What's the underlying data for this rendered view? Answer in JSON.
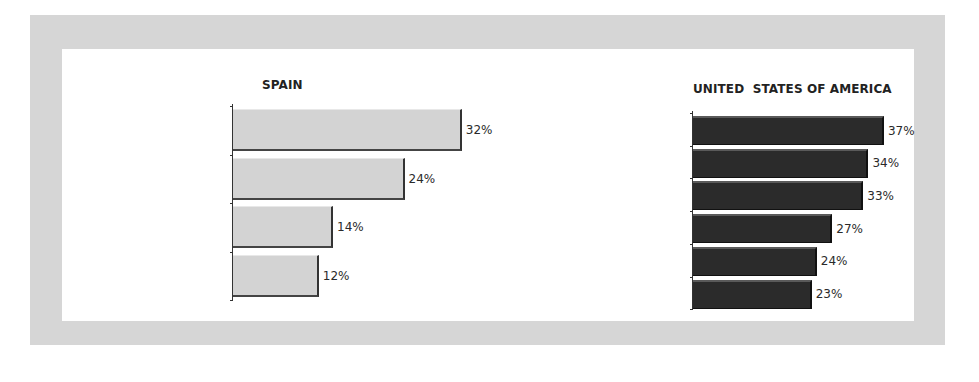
{
  "chart_data": [
    {
      "type": "bar",
      "orientation": "horizontal",
      "title": "SPAIN",
      "categories": [
        "Domestic Service",
        "Construction Day-Laborers",
        "Unskilled Sale Occupations",
        "Agriculture Day-Laborers"
      ],
      "values": [
        32,
        24,
        14,
        12
      ],
      "value_labels": [
        "32%",
        "24%",
        "14%",
        "12%"
      ],
      "unit": "%",
      "xlabel": "",
      "ylabel": "",
      "xlim": [
        0,
        32
      ],
      "grid": false,
      "legend": null,
      "bar_color": "#d3d3d3"
    },
    {
      "type": "bar",
      "orientation": "horizontal",
      "title": "UNITED  STATES OF AMERICA",
      "categories": [
        "Construction Day-Laborers",
        "Domestic Service",
        "Agriculture Day-Laborers",
        "Apparel and Footwear Workers",
        "Janitors",
        "Cooks (no Chefs)"
      ],
      "values": [
        37,
        34,
        33,
        27,
        24,
        23
      ],
      "value_labels": [
        "37%",
        "34%",
        "33%",
        "27%",
        "24%",
        "23%"
      ],
      "unit": "%",
      "xlabel": "",
      "ylabel": "",
      "xlim": [
        0,
        37
      ],
      "grid": false,
      "legend": null,
      "bar_color": "#2b2b2b"
    }
  ],
  "colors": {
    "frame": "#d6d6d6",
    "panel": "#ffffff",
    "light_bar": "#d3d3d3",
    "dark_bar": "#2b2b2b"
  }
}
